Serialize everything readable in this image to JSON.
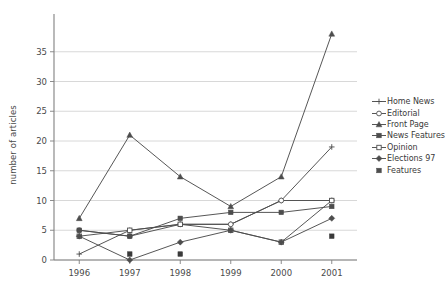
{
  "chart_data": {
    "type": "line",
    "title": "",
    "subtitle": "",
    "xlabel": "",
    "ylabel": "number of articles",
    "categories": [
      "1996",
      "1997",
      "1998",
      "1999",
      "2000",
      "2001"
    ],
    "x": [
      1996,
      1997,
      1998,
      1999,
      2000,
      2001
    ],
    "ylim": [
      0,
      38
    ],
    "xlim": [
      1995.6,
      2001.4
    ],
    "yticks": [
      0,
      5,
      10,
      15,
      20,
      25,
      30,
      35
    ],
    "ytick_labels": [
      "0",
      "5",
      "10",
      "15",
      "20",
      "25",
      "30",
      "35"
    ],
    "grid": "horizontal",
    "legend_position": "right",
    "series": [
      {
        "name": "Home News",
        "marker": "plus",
        "color": "#4d4d4d",
        "values": [
          1,
          5,
          6,
          6,
          10,
          19
        ]
      },
      {
        "name": "Editorial",
        "marker": "open-circle",
        "color": "#4d4d4d",
        "values": [
          5,
          4,
          6,
          6,
          10,
          10
        ]
      },
      {
        "name": "Front Page",
        "marker": "filled-triangle",
        "color": "#4d4d4d",
        "values": [
          7,
          21,
          14,
          9,
          14,
          38
        ]
      },
      {
        "name": "News Features",
        "marker": "filled-square",
        "color": "#4d4d4d",
        "values": [
          5,
          4,
          7,
          8,
          8,
          9
        ]
      },
      {
        "name": "Opinion",
        "marker": "open-square",
        "color": "#4d4d4d",
        "values": [
          4,
          5,
          6,
          5,
          3,
          10
        ]
      },
      {
        "name": "Elections 97",
        "marker": "filled-diamond",
        "color": "#4d4d4d",
        "values": [
          4,
          0,
          3,
          5,
          3,
          7
        ]
      },
      {
        "name": "Features",
        "marker": "filled-square-solo",
        "color": "#3a3a3a",
        "values": [
          null,
          1,
          1,
          null,
          null,
          4
        ]
      }
    ]
  },
  "legend": {
    "items": [
      {
        "label": "Home News",
        "marker": "plus"
      },
      {
        "label": "Editorial",
        "marker": "open-circle"
      },
      {
        "label": "Front Page",
        "marker": "filled-triangle"
      },
      {
        "label": "News Features",
        "marker": "filled-square"
      },
      {
        "label": "Opinion",
        "marker": "open-square"
      },
      {
        "label": "Elections 97",
        "marker": "filled-diamond"
      },
      {
        "label": "Features",
        "marker": "filled-square-solo"
      }
    ]
  },
  "colors": {
    "line": "#4d4d4d",
    "grid": "#d4d4d4",
    "axis": "#808080",
    "text": "#3a3a3a",
    "background": "#ffffff"
  }
}
